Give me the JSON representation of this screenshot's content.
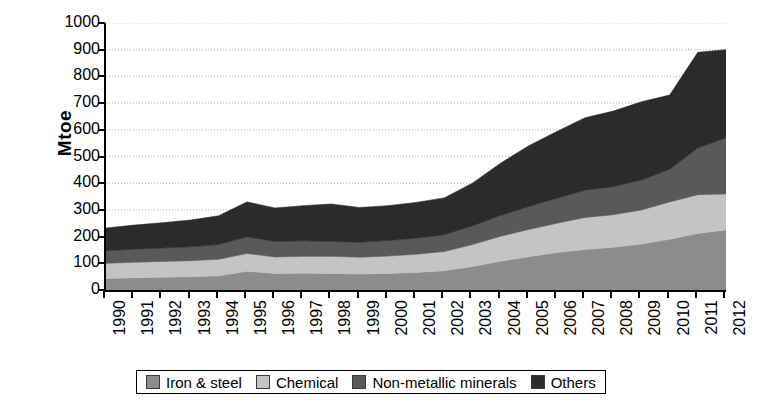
{
  "chart_data": {
    "type": "area",
    "title": "",
    "subtitle": "",
    "xlabel": "",
    "ylabel": "Mtoe",
    "stacked": true,
    "grid": true,
    "legend_position": "bottom",
    "ylim": [
      0,
      1000
    ],
    "ytick_step": 100,
    "yticks": [
      0,
      100,
      200,
      300,
      400,
      500,
      600,
      700,
      800,
      900,
      1000
    ],
    "ytick_labels": [
      "0",
      "100",
      "200",
      "300",
      "400",
      "500",
      "600",
      "700",
      "800",
      "900",
      "1000"
    ],
    "categories": [
      "1990",
      "1991",
      "1992",
      "1993",
      "1994",
      "1995",
      "1996",
      "1997",
      "1998",
      "1999",
      "2000",
      "2001",
      "2002",
      "2003",
      "2004",
      "2005",
      "2006",
      "2007",
      "2008",
      "2009",
      "2010",
      "2011",
      "2012"
    ],
    "series": [
      {
        "name": "Iron & steel",
        "color": "#8c8c8c",
        "values": [
          43,
          46,
          48,
          50,
          53,
          70,
          62,
          63,
          62,
          60,
          62,
          66,
          72,
          88,
          108,
          125,
          140,
          152,
          160,
          172,
          190,
          212,
          225
        ]
      },
      {
        "name": "Chemical",
        "color": "#c4c4c4",
        "values": [
          57,
          58,
          59,
          60,
          62,
          67,
          62,
          63,
          64,
          63,
          65,
          68,
          72,
          82,
          93,
          102,
          110,
          120,
          122,
          128,
          140,
          145,
          135
        ]
      },
      {
        "name": "Non-metallic minerals",
        "color": "#595959",
        "values": [
          47,
          49,
          50,
          52,
          55,
          62,
          58,
          58,
          56,
          56,
          58,
          60,
          63,
          70,
          78,
          86,
          94,
          102,
          105,
          112,
          122,
          175,
          210
        ]
      },
      {
        "name": "Others",
        "color": "#2b2b2b",
        "values": [
          85,
          90,
          95,
          100,
          108,
          131,
          125,
          132,
          140,
          130,
          131,
          134,
          138,
          160,
          196,
          227,
          250,
          271,
          283,
          293,
          278,
          358,
          330
        ]
      }
    ],
    "totals": [
      232,
      243,
      252,
      262,
      278,
      330,
      307,
      316,
      322,
      309,
      316,
      328,
      345,
      400,
      475,
      540,
      594,
      645,
      670,
      705,
      730,
      890,
      900
    ]
  },
  "legend": {
    "items": [
      {
        "label": "Iron & steel",
        "color": "#8c8c8c"
      },
      {
        "label": "Chemical",
        "color": "#c4c4c4"
      },
      {
        "label": "Non-metallic minerals",
        "color": "#595959"
      },
      {
        "label": "Others",
        "color": "#2b2b2b"
      }
    ]
  },
  "axis": {
    "y_title": "Mtoe"
  }
}
